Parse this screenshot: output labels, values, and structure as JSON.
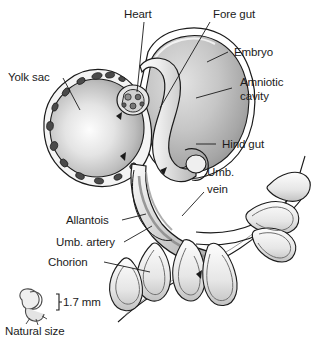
{
  "figure": {
    "style": "grayscale pen-and-ink anatomical illustration",
    "background_color": "#ffffff",
    "ink_color": "#1b1b1b",
    "fill_light": "#f2f2f2",
    "fill_mid": "#b9b9b9",
    "fill_dark": "#8a8a8a"
  },
  "labels": {
    "heart": "Heart",
    "fore_gut": "Fore gut",
    "embryo": "Embryo",
    "amniotic_cavity_line1": "Amniotic",
    "amniotic_cavity_line2": "cavity",
    "hind_gut": "Hind gut",
    "umb_vein_line1": "Umb.",
    "umb_vein_line2": "vein",
    "yolk_sac": "Yolk sac",
    "allantois": "Allantois",
    "umb_artery": "Umb. artery",
    "chorion": "Chorion"
  },
  "scale": {
    "measure": "1.7 mm",
    "caption": "Natural size"
  }
}
